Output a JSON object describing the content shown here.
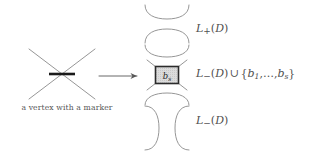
{
  "figure": {
    "type": "knot-diagram-smoothing-states",
    "background_color": "#ffffff",
    "ink_color": "#555555",
    "marker_color": "#1a1a1a",
    "box_fill_color": "#d6d6d6",
    "box_border_color": "#2b2b2b"
  },
  "source": {
    "caption": "a vertex with a marker",
    "vertex_name": "crossing-with-marker",
    "marker_orientation": "horizontal"
  },
  "arrow": {
    "glyph": "⟶",
    "name": "long-rightwards-arrow",
    "direction": "right"
  },
  "states": [
    {
      "id": "l-plus",
      "diagram_name": "horizontal-smoothing",
      "arc_orientation": "horizontal",
      "arc_count": 2,
      "has_box": false,
      "label": {
        "base": "L",
        "subscript": "+",
        "argument": "D",
        "full_text": "L₊(D)"
      }
    },
    {
      "id": "l-minus-union-b",
      "diagram_name": "horizontal-smoothing-with-shaded-box",
      "arc_orientation": "horizontal",
      "arc_count": 2,
      "has_box": true,
      "box_label": {
        "base": "b",
        "subscript": "s",
        "full_text": "bₛ"
      },
      "label": {
        "base": "L",
        "subscript": "−",
        "argument": "D",
        "operator": "∪",
        "set": {
          "open": "{",
          "first": "b",
          "first_subscript": "1",
          "ellipsis": ",…,",
          "last": "b",
          "last_subscript": "s",
          "close": "}"
        },
        "full_text": "L₋(D) ∪ {b₁,…,bₛ}"
      }
    },
    {
      "id": "l-minus",
      "diagram_name": "vertical-smoothing",
      "arc_orientation": "vertical",
      "arc_count": 2,
      "has_box": false,
      "label": {
        "base": "L",
        "subscript": "−",
        "argument": "D",
        "full_text": "L₋(D)"
      }
    }
  ]
}
